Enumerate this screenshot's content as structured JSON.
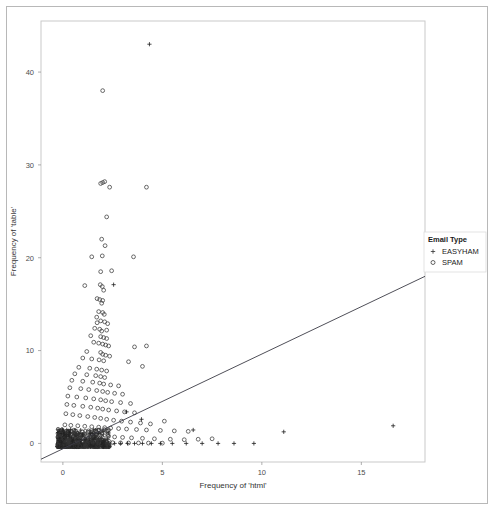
{
  "chart_data": {
    "type": "scatter",
    "title": "",
    "xlabel": "Frequency of 'html'",
    "ylabel": "Frequency of 'table'",
    "xlim": [
      -1.1,
      18.2
    ],
    "ylim": [
      -2.0,
      45.5
    ],
    "xticks": [
      0,
      5,
      10,
      15
    ],
    "xtick_labels": [
      "0",
      "5",
      "10",
      "15"
    ],
    "yticks": [
      0,
      10,
      20,
      30,
      40
    ],
    "ytick_labels": [
      "0",
      "10",
      "20",
      "30",
      "40"
    ],
    "grid": false,
    "legend": {
      "title": "Email Type",
      "position": "right",
      "entries": [
        {
          "label": "EASYHAM",
          "marker": "plus",
          "color": "#333333"
        },
        {
          "label": "SPAM",
          "marker": "circle",
          "color": "#333333"
        }
      ]
    },
    "trendline": {
      "type": "linear",
      "color": "#3b3b45",
      "width": 0.9,
      "x_start": -1.1,
      "y_start": -1.7,
      "x_end": 18.2,
      "y_end": 18.0
    },
    "series": [
      {
        "name": "SPAM",
        "marker": "circle",
        "color": "#3a3a3a",
        "points": [
          [
            2.0,
            38.0
          ],
          [
            1.9,
            28.0
          ],
          [
            2.0,
            28.1
          ],
          [
            2.1,
            28.2
          ],
          [
            2.35,
            27.6
          ],
          [
            4.2,
            27.6
          ],
          [
            2.2,
            24.4
          ],
          [
            1.95,
            22.0
          ],
          [
            2.12,
            21.3
          ],
          [
            1.45,
            20.1
          ],
          [
            1.98,
            20.2
          ],
          [
            3.55,
            20.1
          ],
          [
            1.9,
            18.5
          ],
          [
            2.45,
            18.6
          ],
          [
            1.1,
            17.0
          ],
          [
            1.88,
            17.1
          ],
          [
            1.98,
            16.9
          ],
          [
            2.05,
            16.5
          ],
          [
            1.72,
            15.6
          ],
          [
            1.85,
            15.5
          ],
          [
            2.0,
            15.4
          ],
          [
            1.95,
            15.1
          ],
          [
            1.8,
            14.2
          ],
          [
            2.0,
            14.1
          ],
          [
            2.08,
            13.9
          ],
          [
            1.7,
            13.6
          ],
          [
            1.72,
            13.0
          ],
          [
            1.9,
            13.2
          ],
          [
            2.1,
            13.1
          ],
          [
            2.25,
            12.9
          ],
          [
            1.6,
            12.4
          ],
          [
            1.85,
            12.3
          ],
          [
            1.95,
            12.1
          ],
          [
            2.2,
            12.2
          ],
          [
            1.4,
            11.6
          ],
          [
            1.9,
            11.5
          ],
          [
            2.05,
            11.4
          ],
          [
            2.2,
            11.3
          ],
          [
            1.55,
            10.9
          ],
          [
            1.8,
            10.8
          ],
          [
            2.0,
            10.7
          ],
          [
            2.15,
            10.6
          ],
          [
            2.3,
            10.5
          ],
          [
            3.6,
            10.4
          ],
          [
            4.2,
            10.5
          ],
          [
            1.2,
            9.9
          ],
          [
            1.9,
            9.8
          ],
          [
            2.0,
            9.6
          ],
          [
            2.15,
            9.5
          ],
          [
            2.35,
            9.4
          ],
          [
            1.0,
            9.2
          ],
          [
            1.45,
            9.1
          ],
          [
            1.82,
            9.0
          ],
          [
            2.05,
            8.9
          ],
          [
            3.3,
            8.8
          ],
          [
            4.0,
            8.3
          ],
          [
            0.8,
            8.2
          ],
          [
            1.35,
            8.1
          ],
          [
            1.7,
            8.0
          ],
          [
            1.95,
            7.9
          ],
          [
            2.2,
            7.8
          ],
          [
            0.6,
            7.5
          ],
          [
            1.2,
            7.4
          ],
          [
            1.65,
            7.3
          ],
          [
            1.9,
            7.2
          ],
          [
            2.1,
            7.1
          ],
          [
            0.45,
            6.8
          ],
          [
            1.0,
            6.7
          ],
          [
            1.5,
            6.6
          ],
          [
            1.85,
            6.5
          ],
          [
            2.05,
            6.4
          ],
          [
            2.4,
            6.3
          ],
          [
            2.8,
            6.2
          ],
          [
            0.35,
            6.0
          ],
          [
            0.9,
            5.9
          ],
          [
            1.3,
            5.8
          ],
          [
            1.7,
            5.7
          ],
          [
            2.0,
            5.6
          ],
          [
            2.25,
            5.5
          ],
          [
            2.6,
            5.4
          ],
          [
            3.0,
            5.3
          ],
          [
            0.25,
            5.1
          ],
          [
            0.7,
            5.0
          ],
          [
            1.15,
            4.9
          ],
          [
            1.55,
            4.8
          ],
          [
            1.9,
            4.7
          ],
          [
            2.15,
            4.6
          ],
          [
            2.45,
            4.5
          ],
          [
            2.9,
            4.4
          ],
          [
            3.4,
            4.3
          ],
          [
            0.2,
            4.2
          ],
          [
            0.55,
            4.1
          ],
          [
            1.0,
            4.0
          ],
          [
            1.4,
            3.9
          ],
          [
            1.75,
            3.8
          ],
          [
            2.0,
            3.7
          ],
          [
            2.3,
            3.6
          ],
          [
            2.7,
            3.5
          ],
          [
            3.1,
            3.4
          ],
          [
            3.6,
            3.3
          ],
          [
            0.15,
            3.2
          ],
          [
            0.5,
            3.1
          ],
          [
            0.85,
            3.0
          ],
          [
            1.25,
            2.9
          ],
          [
            1.6,
            2.8
          ],
          [
            1.9,
            2.7
          ],
          [
            2.2,
            2.6
          ],
          [
            2.55,
            2.5
          ],
          [
            2.95,
            2.4
          ],
          [
            3.4,
            2.3
          ],
          [
            3.9,
            2.2
          ],
          [
            4.4,
            2.1
          ],
          [
            5.1,
            2.4
          ],
          [
            0.1,
            2.0
          ],
          [
            0.4,
            1.95
          ],
          [
            0.75,
            1.9
          ],
          [
            1.1,
            1.85
          ],
          [
            1.45,
            1.8
          ],
          [
            1.8,
            1.75
          ],
          [
            2.1,
            1.7
          ],
          [
            2.4,
            1.65
          ],
          [
            2.8,
            1.6
          ],
          [
            3.2,
            1.55
          ],
          [
            3.7,
            1.5
          ],
          [
            4.2,
            1.45
          ],
          [
            4.9,
            1.4
          ],
          [
            5.6,
            1.35
          ],
          [
            6.3,
            1.3
          ],
          [
            0.05,
            1.1
          ],
          [
            0.3,
            1.05
          ],
          [
            0.6,
            1.0
          ],
          [
            0.95,
            0.95
          ],
          [
            1.3,
            0.9
          ],
          [
            1.65,
            0.85
          ],
          [
            1.95,
            0.8
          ],
          [
            2.25,
            0.75
          ],
          [
            2.6,
            0.7
          ],
          [
            3.0,
            0.65
          ],
          [
            3.45,
            0.6
          ],
          [
            4.0,
            0.55
          ],
          [
            4.6,
            0.5
          ],
          [
            5.4,
            0.45
          ],
          [
            6.1,
            0.4
          ],
          [
            6.8,
            0.45
          ],
          [
            7.5,
            0.5
          ],
          [
            0.0,
            0.3
          ],
          [
            0.2,
            0.25
          ],
          [
            0.45,
            0.2
          ],
          [
            0.7,
            0.18
          ],
          [
            1.0,
            0.15
          ],
          [
            1.3,
            0.13
          ],
          [
            1.6,
            0.12
          ],
          [
            1.9,
            0.1
          ],
          [
            2.2,
            0.1
          ],
          [
            2.5,
            0.08
          ],
          [
            2.9,
            0.06
          ],
          [
            3.3,
            0.05
          ],
          [
            3.8,
            0.05
          ],
          [
            4.3,
            0.04
          ],
          [
            5.0,
            0.03
          ],
          [
            0.02,
            0.02
          ],
          [
            0.12,
            0.02
          ],
          [
            0.28,
            0.01
          ],
          [
            0.52,
            0.01
          ],
          [
            0.82,
            0.0
          ],
          [
            1.12,
            0.0
          ],
          [
            1.42,
            0.0
          ],
          [
            1.72,
            0.0
          ],
          [
            2.02,
            0.0
          ],
          [
            2.32,
            0.0
          ]
        ]
      },
      {
        "name": "EASYHAM",
        "marker": "plus",
        "color": "#1f1f1f",
        "points": [
          [
            4.35,
            43.0
          ],
          [
            2.55,
            17.1
          ],
          [
            3.2,
            3.4
          ],
          [
            3.95,
            2.6
          ],
          [
            6.55,
            1.45
          ],
          [
            11.1,
            1.25
          ],
          [
            16.6,
            1.9
          ],
          [
            0.05,
            0.05
          ],
          [
            0.25,
            0.04
          ],
          [
            0.5,
            0.03
          ],
          [
            0.8,
            0.02
          ],
          [
            1.1,
            0.02
          ],
          [
            1.4,
            0.01
          ],
          [
            1.7,
            0.01
          ],
          [
            2.0,
            0.0
          ],
          [
            2.3,
            0.0
          ],
          [
            2.6,
            0.0
          ],
          [
            2.9,
            0.0
          ],
          [
            3.25,
            0.0
          ],
          [
            3.6,
            0.0
          ],
          [
            4.0,
            0.0
          ],
          [
            4.45,
            0.0
          ],
          [
            4.9,
            0.0
          ],
          [
            5.5,
            0.0
          ],
          [
            6.2,
            0.0
          ],
          [
            7.0,
            0.0
          ],
          [
            7.8,
            0.0
          ],
          [
            8.6,
            0.0
          ],
          [
            9.6,
            0.0
          ]
        ]
      }
    ]
  },
  "panel": {
    "left": 41,
    "top": 21,
    "right": 425,
    "bottom": 462,
    "border_color": "#c9c9c9",
    "background": "#ffffff"
  }
}
